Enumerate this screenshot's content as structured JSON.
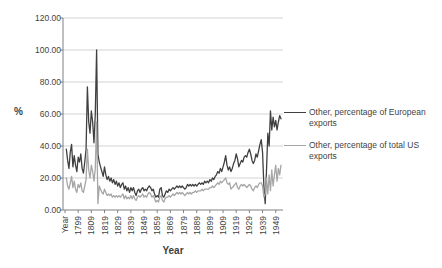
{
  "chart_data": {
    "type": "line",
    "title": "",
    "xlabel": "Year",
    "ylabel": "%",
    "ylim": [
      0,
      120
    ],
    "ytick_step": 20,
    "ytick_labels": [
      "0.00",
      "20.00",
      "40.00",
      "60.00",
      "80.00",
      "100.00",
      "120.00"
    ],
    "grid": true,
    "legend_position": "right",
    "x_first_category": "Year",
    "x_years_start": 1790,
    "x_years_end": 1953,
    "xtick_labels": [
      "Year",
      "1799",
      "1809",
      "1819",
      "1829",
      "1839",
      "1849",
      "1859",
      "1869",
      "1879",
      "1889",
      "1899",
      "1909",
      "1919",
      "1929",
      "1939",
      "1949"
    ],
    "series": [
      {
        "name": "Other, percentage of European exports",
        "color": "#404040",
        "values": [
          null,
          38,
          31,
          26,
          36,
          41,
          27,
          34,
          28,
          24,
          33,
          30,
          35,
          26,
          23,
          30,
          38,
          77,
          55,
          48,
          62,
          55,
          42,
          60,
          100,
          35,
          30,
          27,
          24,
          21,
          27,
          22,
          19,
          21,
          18,
          20,
          17,
          19,
          16,
          18,
          15,
          17,
          14,
          16,
          17,
          13,
          15,
          12,
          14,
          11,
          14,
          12,
          14,
          11,
          9,
          12,
          13,
          11,
          13,
          14,
          12,
          13,
          12,
          14,
          15,
          14,
          12,
          13,
          10,
          8,
          9,
          8,
          13,
          14,
          9,
          8,
          10,
          12,
          11,
          13,
          12,
          13,
          14,
          13,
          14,
          15,
          14,
          15,
          14,
          15,
          14,
          13,
          14,
          16,
          15,
          16,
          15,
          16,
          15,
          16,
          15,
          16,
          17,
          16,
          17,
          16,
          18,
          17,
          18,
          17,
          19,
          18,
          20,
          19,
          21,
          22,
          24,
          23,
          26,
          24,
          27,
          30,
          34,
          28,
          25,
          27,
          24,
          26,
          29,
          31,
          35,
          32,
          27,
          29,
          31,
          30,
          33,
          34,
          33,
          36,
          38,
          35,
          31,
          29,
          31,
          35,
          33,
          37,
          41,
          44,
          36,
          15,
          4,
          25,
          48,
          40,
          62,
          50,
          58,
          52,
          56,
          50,
          55,
          59,
          57
        ]
      },
      {
        "name": "Other, percentage of total US exports",
        "color": "#A6A6A6",
        "values": [
          null,
          20,
          15,
          13,
          17,
          21,
          14,
          18,
          13,
          11,
          16,
          14,
          17,
          12,
          11,
          15,
          19,
          38,
          25,
          20,
          28,
          24,
          18,
          26,
          55,
          4,
          15,
          13,
          11,
          10,
          13,
          11,
          9,
          10,
          9,
          10,
          8,
          9,
          8,
          9,
          8,
          9,
          8,
          9,
          10,
          7,
          9,
          7,
          8,
          7,
          9,
          7,
          9,
          7,
          6,
          8,
          9,
          8,
          9,
          10,
          8,
          9,
          8,
          10,
          11,
          10,
          8,
          9,
          7,
          5,
          6,
          5,
          8,
          9,
          6,
          5,
          7,
          8,
          8,
          9,
          8,
          9,
          10,
          9,
          10,
          11,
          10,
          11,
          10,
          11,
          10,
          9,
          10,
          11,
          10,
          11,
          10,
          11,
          11,
          12,
          11,
          12,
          12,
          12,
          13,
          12,
          13,
          13,
          13,
          13,
          14,
          14,
          15,
          14,
          15,
          16,
          17,
          16,
          18,
          17,
          18,
          19,
          20,
          17,
          16,
          17,
          13,
          14,
          15,
          16,
          17,
          14,
          13,
          15,
          16,
          15,
          16,
          15,
          14,
          15,
          16,
          15,
          13,
          12,
          14,
          15,
          14,
          16,
          17,
          17,
          15,
          8,
          10,
          20,
          10,
          22,
          12,
          25,
          15,
          22,
          28,
          18,
          26,
          22,
          28
        ]
      }
    ]
  },
  "colors": {
    "background": "#FFFFFF",
    "gridline": "#D3D3D3",
    "axis": "#808080",
    "tick_text": "#3F3F3F",
    "series_european": "#404040",
    "series_us": "#A6A6A6"
  }
}
